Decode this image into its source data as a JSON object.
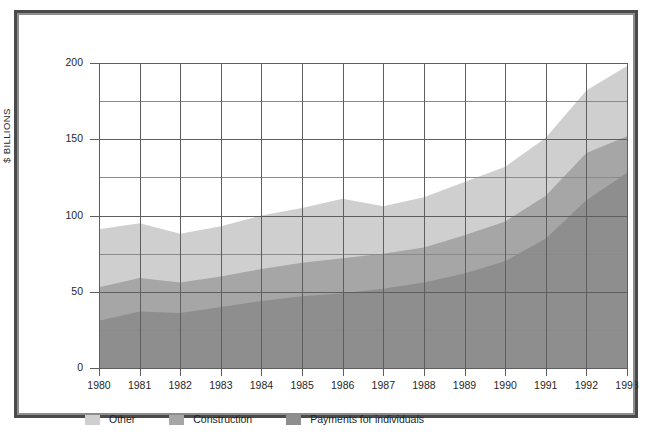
{
  "chart_data": {
    "type": "area",
    "stacked": true,
    "title": "",
    "subtitle": "",
    "xlabel": "",
    "ylabel": "$ BILLIONS",
    "grid": true,
    "legend_position": "bottom-left",
    "xlim": [
      1980,
      1993
    ],
    "ylim": [
      0,
      200
    ],
    "ytick_labels": [
      "0",
      "50",
      "100",
      "150",
      "200"
    ],
    "ytick_values": [
      0,
      50,
      100,
      150,
      200
    ],
    "yminor_values": [
      25,
      75,
      125,
      175
    ],
    "categories": [
      1980,
      1981,
      1982,
      1983,
      1984,
      1985,
      1986,
      1987,
      1988,
      1989,
      1990,
      1991,
      1992,
      1993
    ],
    "xtick_labels": [
      "1980",
      "1981",
      "1982",
      "1983",
      "1984",
      "1985",
      "1986",
      "1987",
      "1988",
      "1989",
      "1990",
      "1991",
      "1992",
      "1993"
    ],
    "series": [
      {
        "name": "Payments for individuals",
        "color": "#8e8e8e",
        "values": [
          31,
          37,
          36,
          40,
          44,
          47,
          49,
          52,
          56,
          62,
          70,
          85,
          110,
          128
        ]
      },
      {
        "name": "Construction",
        "color": "#a6a6a6",
        "values": [
          22,
          22,
          20,
          20,
          21,
          22,
          23,
          23,
          23,
          25,
          26,
          28,
          31,
          24
        ]
      },
      {
        "name": "Other",
        "color": "#cfcfcf",
        "values": [
          38,
          36,
          32,
          33,
          35,
          36,
          39,
          31,
          33,
          35,
          36,
          38,
          41,
          46
        ]
      }
    ],
    "totals": [
      91,
      95,
      88,
      93,
      100,
      105,
      111,
      106,
      112,
      122,
      132,
      151,
      182,
      198
    ]
  },
  "legend": {
    "items": [
      {
        "label": "Other",
        "color": "#cfcfcf"
      },
      {
        "label": "Construction",
        "color": "#a6a6a6"
      },
      {
        "label": "Payments for individuals",
        "color": "#8e8e8e"
      }
    ]
  },
  "axis": {
    "y_title": "$ BILLIONS"
  },
  "colors": {
    "frame": "#4a4a4a",
    "gridline": "#6f6f6f",
    "background": "#ffffff",
    "text": "#272727"
  }
}
